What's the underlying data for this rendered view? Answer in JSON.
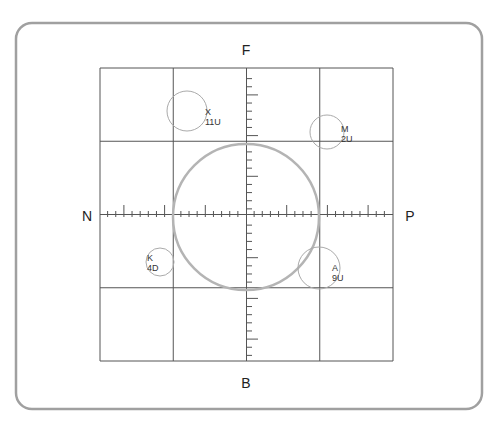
{
  "panel": {
    "x": 16,
    "y": 23,
    "width": 466,
    "height": 386,
    "radius": 16,
    "stroke": "#a0a0a0"
  },
  "grid": {
    "x": 100,
    "y": 68,
    "size": 293,
    "cells": 4,
    "stroke": "#555555"
  },
  "center": {
    "x": 246,
    "y": 217
  },
  "ring": {
    "radius": 73,
    "stroke": "#b4b4b4"
  },
  "axis_labels": {
    "top": "F",
    "bottom": "B",
    "left": "N",
    "right": "P"
  },
  "ticks": {
    "spacing": 8.14,
    "major_every": 5,
    "minor_len": 6,
    "major_len": 12,
    "stroke": "#555555"
  },
  "targets": [
    {
      "id": "X",
      "range": "11U",
      "cx": 187,
      "cy": 111,
      "r": 20,
      "label_x": 205,
      "label_y": 107
    },
    {
      "id": "M",
      "range": "2U",
      "cx": 327,
      "cy": 132,
      "r": 17,
      "label_x": 341,
      "label_y": 124
    },
    {
      "id": "K",
      "range": "4D",
      "cx": 160,
      "cy": 262,
      "r": 14,
      "label_x": 147,
      "label_y": 253
    },
    {
      "id": "A",
      "range": "9U",
      "cx": 319,
      "cy": 268,
      "r": 21,
      "label_x": 332,
      "label_y": 263
    }
  ]
}
